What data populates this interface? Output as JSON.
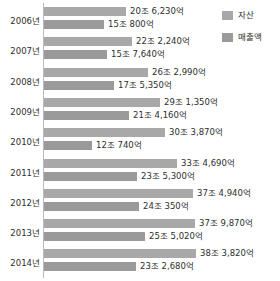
{
  "chart_data": {
    "type": "bar",
    "orientation": "horizontal",
    "title": "",
    "subtitle": "",
    "xlabel": "",
    "ylabel": "",
    "grid": false,
    "legend_position": "top-right",
    "unit_note": "조 = trillion KRW, 억 = hundred million KRW",
    "axis_min_px": 44,
    "px_per_trillion": 3.97,
    "xlim": [
      0,
      42
    ],
    "categories": [
      "2006년",
      "2007년",
      "2008년",
      "2009년",
      "2010년",
      "2011년",
      "2012년",
      "2013년",
      "2014년"
    ],
    "series": [
      {
        "name": "자산",
        "color": "#a8a8a8",
        "values": [
          20.623,
          22.224,
          26.299,
          29.135,
          30.387,
          33.469,
          37.494,
          37.987,
          38.382
        ],
        "labels": [
          "20조 6,230억",
          "22조 2,240억",
          "26조 2,990억",
          "29조 1,350억",
          "30조 3,870억",
          "33조 4,690억",
          "37조 4,940억",
          "37조 9,870억",
          "38조 3,820억"
        ]
      },
      {
        "name": "매출액",
        "color": "#9a9a9a",
        "values": [
          15.08,
          15.764,
          17.535,
          21.416,
          12.074,
          23.53,
          24.035,
          25.502,
          23.268
        ],
        "labels": [
          "15조 800억",
          "15조 7,640억",
          "17조 5,350억",
          "21조 4,160억",
          "12조 740억",
          "23조 5,300억",
          "24조 350억",
          "25조 5,020억",
          "23조 2,680억"
        ]
      }
    ]
  },
  "legend": {
    "items": [
      {
        "label": "자산",
        "color": "#a8a8a8",
        "icon": "square-swatch-icon"
      },
      {
        "label": "매출액",
        "color": "#9a9a9a",
        "icon": "square-swatch-icon"
      }
    ]
  },
  "groups": [
    {
      "year": "2006년",
      "asset_label": "20조 6,230억",
      "asset_value": 20.623,
      "sales_label": "15조 800억",
      "sales_value": 15.08
    },
    {
      "year": "2007년",
      "asset_label": "22조 2,240억",
      "asset_value": 22.224,
      "sales_label": "15조 7,640억",
      "sales_value": 15.764
    },
    {
      "year": "2008년",
      "asset_label": "26조 2,990억",
      "asset_value": 26.299,
      "sales_label": "17조 5,350억",
      "sales_value": 17.535
    },
    {
      "year": "2009년",
      "asset_label": "29조 1,350억",
      "asset_value": 29.135,
      "sales_label": "21조 4,160억",
      "sales_value": 21.416
    },
    {
      "year": "2010년",
      "asset_label": "30조 3,870억",
      "asset_value": 30.387,
      "sales_label": "12조 740억",
      "sales_value": 12.074
    },
    {
      "year": "2011년",
      "asset_label": "33조 4,690억",
      "asset_value": 33.469,
      "sales_label": "23조 5,300억",
      "sales_value": 23.53
    },
    {
      "year": "2012년",
      "asset_label": "37조 4,940억",
      "asset_value": 37.494,
      "sales_label": "24조 350억",
      "sales_value": 24.035
    },
    {
      "year": "2013년",
      "asset_label": "37조 9,870억",
      "asset_value": 37.987,
      "sales_label": "25조 5,020억",
      "sales_value": 25.502
    },
    {
      "year": "2014년",
      "asset_label": "38조 3,820억",
      "asset_value": 38.382,
      "sales_label": "23조 2,680억",
      "sales_value": 23.268
    }
  ]
}
